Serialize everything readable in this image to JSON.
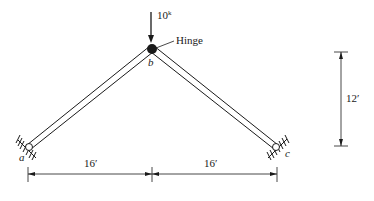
{
  "diagram": {
    "type": "three-hinged frame",
    "load": {
      "value": "10",
      "unit": "k",
      "point": "b",
      "direction": "down"
    },
    "hinge_label": "Hinge",
    "nodes": [
      {
        "id": "a",
        "label": "a",
        "support": "pin"
      },
      {
        "id": "b",
        "label": "b",
        "support": "hinge"
      },
      {
        "id": "c",
        "label": "c",
        "support": "pin"
      }
    ],
    "dimensions": {
      "left_span": "16′",
      "right_span": "16′",
      "height": "12′"
    },
    "colors": {
      "ink": "#1a1a1a",
      "background": "#ffffff"
    }
  }
}
